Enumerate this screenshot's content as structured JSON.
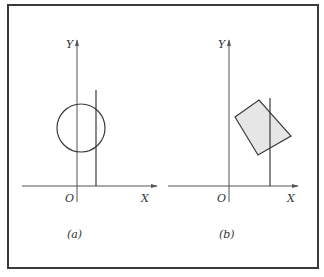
{
  "figure": {
    "frame_color": "#3a3a3a",
    "line_color": "#3a3a3a",
    "fill_color": "#e6e6e6",
    "panels": [
      {
        "id": "a",
        "caption": "(a)",
        "axis_x_label": "X",
        "axis_y_label": "Y",
        "origin_label": "O",
        "shape": "circle",
        "circle": {
          "cx": 81,
          "cy": 128,
          "r": 24
        },
        "vertical_line": {
          "x": 96,
          "y1": 90,
          "y2": 186
        },
        "axes": {
          "ox": 77,
          "oy": 186,
          "x_end": 157,
          "x_start": 22,
          "y_top": 40,
          "y_bottom": 202
        }
      },
      {
        "id": "b",
        "caption": "(b)",
        "axis_x_label": "X",
        "axis_y_label": "Y",
        "origin_label": "O",
        "shape": "quadrilateral",
        "polygon": "235,117 259,100 291,136 258,155",
        "vertical_line": {
          "x": 270,
          "y1": 98,
          "y2": 186
        },
        "axes": {
          "ox": 229,
          "oy": 186,
          "x_end": 298,
          "x_start": 168,
          "y_top": 40,
          "y_bottom": 202
        }
      }
    ]
  }
}
